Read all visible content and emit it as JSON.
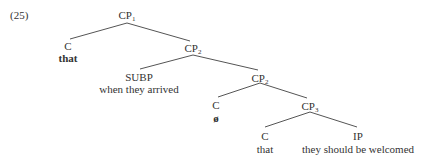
{
  "example_number": "(25)",
  "nodes": {
    "cp1": {
      "cat": "CP",
      "sub": "1"
    },
    "c_top": {
      "cat": "C",
      "word": "that"
    },
    "cp2_upper": {
      "cat": "CP",
      "sub": "2"
    },
    "subp": {
      "cat": "SUBP",
      "word": "when they arrived"
    },
    "cp2_lower": {
      "cat": "CP",
      "sub": "2"
    },
    "c_mid": {
      "cat": "C",
      "word": "ø"
    },
    "cp3": {
      "cat": "CP",
      "sub": "3"
    },
    "c_low": {
      "cat": "C",
      "word": "that"
    },
    "ip": {
      "cat": "IP",
      "word": "they should be welcomed"
    }
  }
}
